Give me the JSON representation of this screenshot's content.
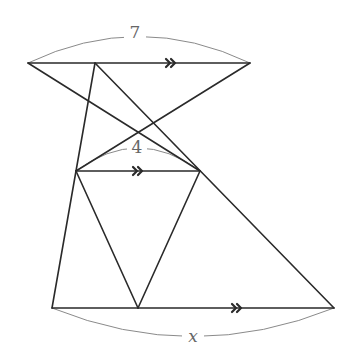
{
  "diagram": {
    "type": "geometry-similar-triangles",
    "colors": {
      "line": "#2a2a2a",
      "dimension_arc": "#8a8a8a",
      "label": "#666666",
      "background": "#ffffff"
    },
    "points": {
      "A": [
        28,
        63
      ],
      "P": [
        95,
        63
      ],
      "B": [
        250,
        63
      ],
      "M": [
        76,
        171
      ],
      "N": [
        200,
        171
      ],
      "C": [
        52,
        308
      ],
      "Q": [
        138,
        308
      ],
      "D": [
        334,
        308
      ]
    },
    "segments": [
      {
        "id": "top",
        "from": "A",
        "to": "B",
        "parallel_mark": "double-arrow",
        "mark_at": [
          170,
          63
        ]
      },
      {
        "id": "middle",
        "from": "M",
        "to": "N",
        "parallel_mark": "double-arrow",
        "mark_at": [
          137,
          171
        ]
      },
      {
        "id": "bottom",
        "from": "C",
        "to": "D",
        "parallel_mark": "double-arrow",
        "mark_at": [
          236,
          308
        ]
      },
      {
        "id": "A-N",
        "from": "A",
        "to": "N"
      },
      {
        "id": "B-M",
        "from": "B",
        "to": "M"
      },
      {
        "id": "P-M",
        "from": "P",
        "to": "M"
      },
      {
        "id": "P-D",
        "from": "P",
        "to": "D"
      },
      {
        "id": "M-C",
        "from": "M",
        "to": "C"
      },
      {
        "id": "M-Q",
        "from": "M",
        "to": "Q"
      },
      {
        "id": "N-Q",
        "from": "N",
        "to": "Q"
      }
    ],
    "labels": {
      "top_length": "7",
      "middle_length": "4",
      "bottom_length": "x"
    }
  }
}
